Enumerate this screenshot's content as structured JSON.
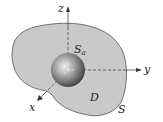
{
  "figure": {
    "axes": {
      "x": "x",
      "y": "y",
      "z": "z"
    },
    "labels": {
      "inner_surface": "S",
      "inner_surface_sub": "a",
      "region": "D",
      "outer_surface": "S"
    },
    "colors": {
      "region_fill": "#c9c9c9",
      "outline": "#555555",
      "sphere_light": "#f0f0f0",
      "sphere_dark": "#3a3a3a"
    }
  }
}
